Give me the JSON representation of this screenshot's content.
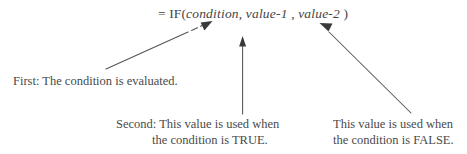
{
  "diagram": {
    "background_color": "#ffffff",
    "ink_color": "#4a4a4a",
    "formula": {
      "equals": "=",
      "function_name": "IF(",
      "arg1": "condition",
      "separator1": ",",
      "arg2": "value-1",
      "separator2": ",",
      "arg3": "value-2",
      "close_paren": ")",
      "full_text": "= IF(condition, value-1 , value-2 )"
    },
    "captions": [
      {
        "id": "first",
        "line1": "First: The condition is evaluated.",
        "line2": ""
      },
      {
        "id": "second",
        "line1": "Second:  This value is used when",
        "line2": "the condition is TRUE."
      },
      {
        "id": "third",
        "line1": "This value is used when",
        "line2": "the condition is FALSE."
      }
    ],
    "arrows": [
      {
        "id": "arrow-to-condition",
        "from": "first-caption",
        "to": "condition",
        "style": "diagonal-dashed-break",
        "direction": "up-right"
      },
      {
        "id": "arrow-to-value-1",
        "from": "second-caption",
        "to": "value-1",
        "style": "vertical",
        "direction": "up"
      },
      {
        "id": "arrow-to-value-2",
        "from": "third-caption",
        "to": "value-2",
        "style": "diagonal",
        "direction": "up-left"
      }
    ]
  }
}
